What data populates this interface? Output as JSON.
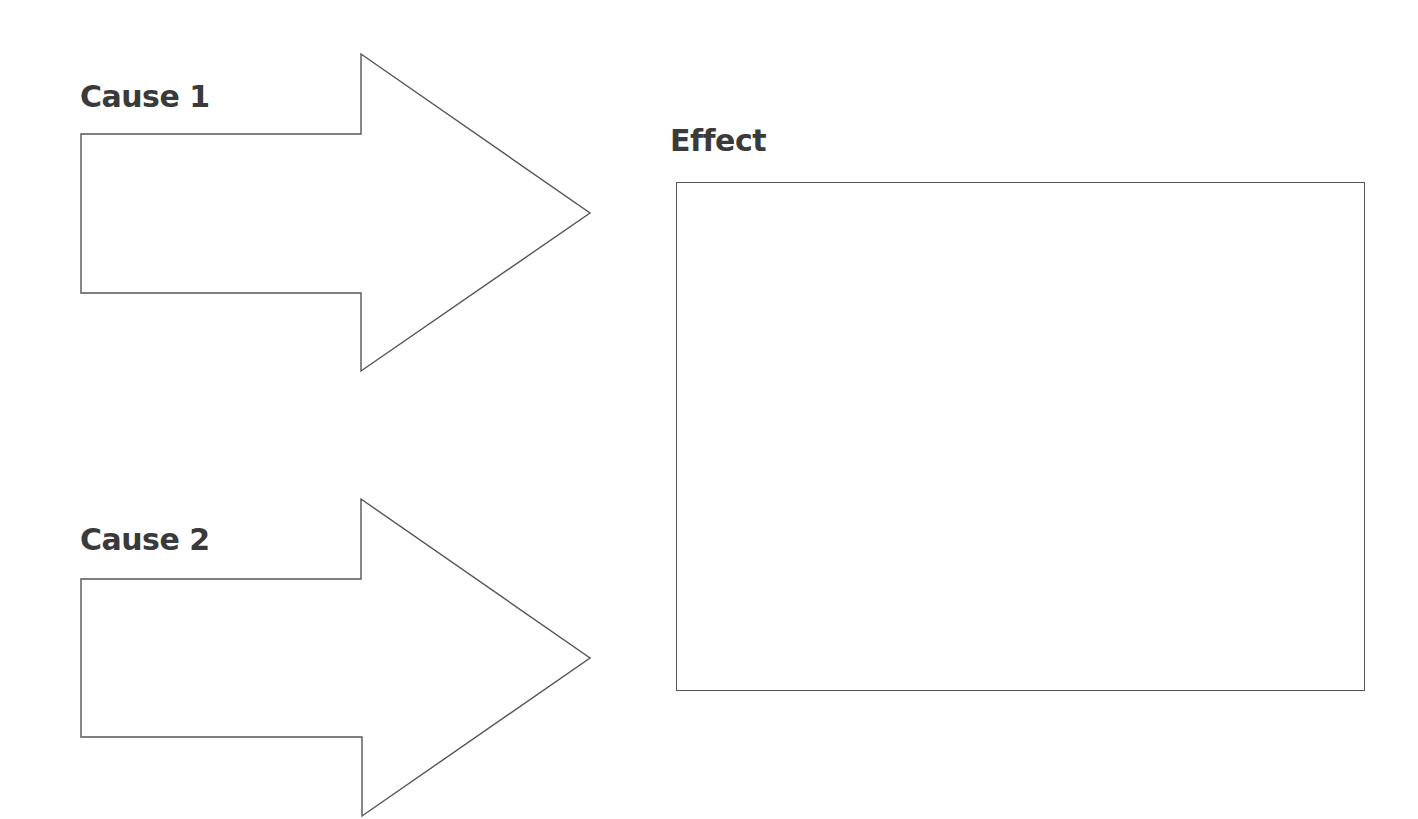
{
  "diagram": {
    "type": "cause-and-effect graphic organizer",
    "causes": [
      {
        "label": "Cause 1",
        "arrow_points": "81,134 361,134 361,54 590,213 361,371 361,293 81,293",
        "content": ""
      },
      {
        "label": "Cause 2",
        "arrow_points": "81,579 361,579 361,499 590,658 362,816 362,737 81,737",
        "content": ""
      }
    ],
    "effect": {
      "label": "Effect",
      "content": ""
    },
    "colors": {
      "background": "#ffffff",
      "stroke": "#555555",
      "text": "#3a3a3a"
    }
  }
}
